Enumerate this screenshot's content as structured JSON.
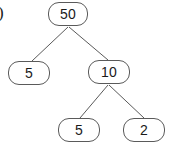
{
  "figure": {
    "label": ")",
    "background_color": "#ffffff",
    "node_stroke_color": "#5a5a5a",
    "edge_stroke_color": "#5a5a5a",
    "text_color": "#1a1a1a"
  },
  "chart_data": {
    "type": "diagram",
    "title": "",
    "diagram_kind": "binary-tree",
    "nodes": [
      {
        "id": "root",
        "value": "50",
        "x": 48,
        "y": 2,
        "w": 40,
        "h": 24
      },
      {
        "id": "left",
        "value": "5",
        "x": 8,
        "y": 61,
        "w": 42,
        "h": 24
      },
      {
        "id": "right",
        "value": "10",
        "x": 88,
        "y": 60,
        "w": 42,
        "h": 24
      },
      {
        "id": "right-left",
        "value": "5",
        "x": 58,
        "y": 118,
        "w": 42,
        "h": 24
      },
      {
        "id": "right-right",
        "value": "2",
        "x": 123,
        "y": 118,
        "w": 42,
        "h": 24
      }
    ],
    "edges": [
      {
        "from": "root",
        "to": "left",
        "x1": 68,
        "y1": 27,
        "x2": 32,
        "y2": 61
      },
      {
        "from": "root",
        "to": "right",
        "x1": 69,
        "y1": 27,
        "x2": 108,
        "y2": 60
      },
      {
        "from": "right",
        "to": "right-left",
        "x1": 108,
        "y1": 85,
        "x2": 80,
        "y2": 118
      },
      {
        "from": "right",
        "to": "right-right",
        "x1": 109,
        "y1": 85,
        "x2": 144,
        "y2": 118
      }
    ]
  }
}
